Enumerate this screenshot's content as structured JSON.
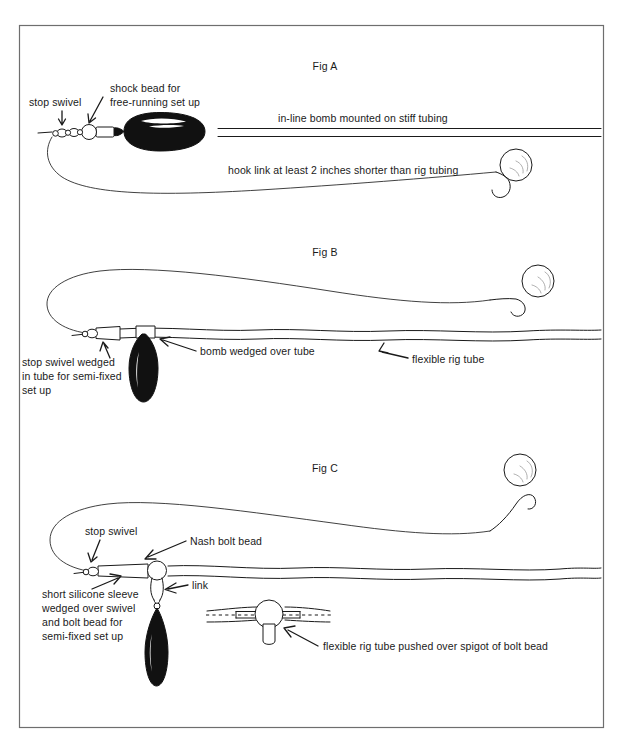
{
  "page": {
    "background_color": "#ffffff",
    "ink_color": "#1a1a1a",
    "frame_color": "#6e6e6e"
  },
  "figures": [
    {
      "id": "fig-a",
      "caption": "Fig A",
      "labels": {
        "stop_swivel": "stop swivel",
        "shock_bead_line1": "shock bead for",
        "shock_bead_line2": "free-running set up",
        "tubing": "in-line bomb mounted on stiff tubing",
        "hook_link": "hook link at least 2 inches shorter than rig tubing"
      }
    },
    {
      "id": "fig-b",
      "caption": "Fig B",
      "labels": {
        "stop_swivel_line1": "stop swivel wedged",
        "stop_swivel_line2": "in tube for semi-fixed",
        "stop_swivel_line3": "set up",
        "bomb_wedged": "bomb wedged over tube",
        "flexible_tube": "flexible rig tube"
      }
    },
    {
      "id": "fig-c",
      "caption": "Fig C",
      "labels": {
        "stop_swivel": "stop swivel",
        "nash_bolt_bead": "Nash bolt bead",
        "link": "link",
        "sleeve_line1": "short silicone sleeve",
        "sleeve_line2": "wedged over swivel",
        "sleeve_line3": "and bolt bead for",
        "sleeve_line4": "semi-fixed set up",
        "inset_caption": "flexible rig tube pushed over spigot of bolt bead"
      }
    }
  ]
}
